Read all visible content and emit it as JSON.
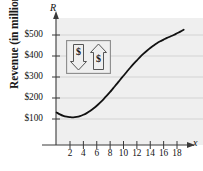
{
  "figure": {
    "width": 203,
    "height": 171,
    "background": "#ffffff",
    "plot_background": "#efefef",
    "gridline_color": "#c9c9c9",
    "axis_color": "#3a3a3a",
    "curve_color": "#111111"
  },
  "axis_names": {
    "y": "R",
    "x": "x"
  },
  "decoration": {
    "box_name": "dollar-sign-illustration",
    "symbols": [
      "$",
      "$"
    ],
    "arrow_directions": [
      "down",
      "up"
    ],
    "border_color": "#8a8a8a"
  },
  "chart_data": {
    "type": "line",
    "title": "",
    "subtitle": "",
    "xlabel": "x",
    "ylabel": "Revenue (in millions)",
    "ylabel_ticks": [
      "$100",
      "$200",
      "$300",
      "$400",
      "$500"
    ],
    "ytick_values": [
      100,
      200,
      300,
      400,
      500
    ],
    "xtick_labels": [
      "2",
      "4",
      "6",
      "8",
      "10",
      "12",
      "14",
      "16",
      "18"
    ],
    "xtick_values": [
      2,
      4,
      6,
      8,
      10,
      12,
      14,
      16,
      18
    ],
    "xlim": [
      0,
      19.5
    ],
    "ylim": [
      0,
      580
    ],
    "grid": "horizontal",
    "legend": "none",
    "series": [
      {
        "name": "Revenue",
        "x": [
          0,
          0.5,
          1,
          1.5,
          2,
          2.5,
          3,
          3.5,
          4,
          4.5,
          5,
          5.5,
          6,
          6.5,
          7,
          7.5,
          8,
          8.5,
          9,
          9.5,
          10,
          10.5,
          11,
          11.5,
          12,
          12.5,
          13,
          13.5,
          14,
          14.5,
          15,
          15.5,
          16,
          16.5,
          17,
          17.5,
          18,
          18.5,
          19
        ],
        "values": [
          131,
          122,
          115,
          111,
          109,
          108,
          110,
          114,
          120,
          128,
          138,
          150,
          163,
          178,
          194,
          211,
          229,
          248,
          267,
          287,
          306,
          325,
          344,
          362,
          379,
          396,
          411,
          425,
          438,
          450,
          461,
          470,
          478,
          486,
          493,
          500,
          508,
          516,
          525
        ],
        "color": "#111111",
        "line_width": 1.8
      }
    ],
    "annotations": []
  }
}
